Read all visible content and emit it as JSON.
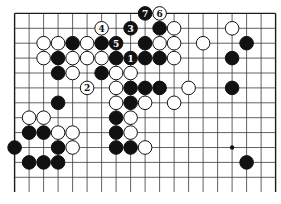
{
  "diagram": {
    "type": "go-board-partial",
    "columns": 19,
    "visible_rows": 12,
    "edges": {
      "top": true,
      "left": true,
      "right": true,
      "bottom": false
    },
    "colors": {
      "black": "#111111",
      "white": "#ffffff",
      "line": "#3a3a3a",
      "background": "#ffffff"
    },
    "star_points": [
      {
        "col": 15,
        "row": 9
      }
    ],
    "stones": [
      {
        "col": 9,
        "row": 0,
        "color": "black",
        "label": "7"
      },
      {
        "col": 10,
        "row": 0,
        "color": "white",
        "label": "6"
      },
      {
        "col": 6,
        "row": 1,
        "color": "white",
        "label": "4"
      },
      {
        "col": 8,
        "row": 1,
        "color": "black",
        "label": "3"
      },
      {
        "col": 10,
        "row": 1,
        "color": "black"
      },
      {
        "col": 11,
        "row": 1,
        "color": "white"
      },
      {
        "col": 15,
        "row": 1,
        "color": "white"
      },
      {
        "col": 2,
        "row": 2,
        "color": "white"
      },
      {
        "col": 3,
        "row": 2,
        "color": "white"
      },
      {
        "col": 4,
        "row": 2,
        "color": "black"
      },
      {
        "col": 5,
        "row": 2,
        "color": "white"
      },
      {
        "col": 6,
        "row": 2,
        "color": "black"
      },
      {
        "col": 7,
        "row": 2,
        "color": "black",
        "label": "5"
      },
      {
        "col": 9,
        "row": 2,
        "color": "black"
      },
      {
        "col": 10,
        "row": 2,
        "color": "white"
      },
      {
        "col": 11,
        "row": 2,
        "color": "white"
      },
      {
        "col": 13,
        "row": 2,
        "color": "white"
      },
      {
        "col": 16,
        "row": 2,
        "color": "black"
      },
      {
        "col": 2,
        "row": 3,
        "color": "white"
      },
      {
        "col": 3,
        "row": 3,
        "color": "black"
      },
      {
        "col": 4,
        "row": 3,
        "color": "white"
      },
      {
        "col": 5,
        "row": 3,
        "color": "white"
      },
      {
        "col": 6,
        "row": 3,
        "color": "white"
      },
      {
        "col": 7,
        "row": 3,
        "color": "black"
      },
      {
        "col": 8,
        "row": 3,
        "color": "black",
        "label": "1"
      },
      {
        "col": 9,
        "row": 3,
        "color": "black"
      },
      {
        "col": 10,
        "row": 3,
        "color": "black"
      },
      {
        "col": 11,
        "row": 3,
        "color": "white"
      },
      {
        "col": 15,
        "row": 3,
        "color": "black"
      },
      {
        "col": 3,
        "row": 4,
        "color": "black"
      },
      {
        "col": 4,
        "row": 4,
        "color": "white"
      },
      {
        "col": 6,
        "row": 4,
        "color": "black"
      },
      {
        "col": 7,
        "row": 4,
        "color": "white"
      },
      {
        "col": 8,
        "row": 4,
        "color": "white"
      },
      {
        "col": 5,
        "row": 5,
        "color": "white",
        "label": "2"
      },
      {
        "col": 7,
        "row": 5,
        "color": "white"
      },
      {
        "col": 8,
        "row": 5,
        "color": "black"
      },
      {
        "col": 9,
        "row": 5,
        "color": "black"
      },
      {
        "col": 10,
        "row": 5,
        "color": "black"
      },
      {
        "col": 12,
        "row": 5,
        "color": "white"
      },
      {
        "col": 15,
        "row": 5,
        "color": "black"
      },
      {
        "col": 3,
        "row": 6,
        "color": "black"
      },
      {
        "col": 7,
        "row": 6,
        "color": "white"
      },
      {
        "col": 8,
        "row": 6,
        "color": "black"
      },
      {
        "col": 9,
        "row": 6,
        "color": "white"
      },
      {
        "col": 11,
        "row": 6,
        "color": "white"
      },
      {
        "col": 1,
        "row": 7,
        "color": "white"
      },
      {
        "col": 2,
        "row": 7,
        "color": "white"
      },
      {
        "col": 7,
        "row": 7,
        "color": "black"
      },
      {
        "col": 8,
        "row": 7,
        "color": "white"
      },
      {
        "col": 1,
        "row": 8,
        "color": "black"
      },
      {
        "col": 2,
        "row": 8,
        "color": "black"
      },
      {
        "col": 3,
        "row": 8,
        "color": "white"
      },
      {
        "col": 4,
        "row": 8,
        "color": "white"
      },
      {
        "col": 7,
        "row": 8,
        "color": "black"
      },
      {
        "col": 8,
        "row": 8,
        "color": "white"
      },
      {
        "col": 0,
        "row": 9,
        "color": "black"
      },
      {
        "col": 3,
        "row": 9,
        "color": "black"
      },
      {
        "col": 4,
        "row": 9,
        "color": "white"
      },
      {
        "col": 7,
        "row": 9,
        "color": "black"
      },
      {
        "col": 8,
        "row": 9,
        "color": "black"
      },
      {
        "col": 9,
        "row": 9,
        "color": "white"
      },
      {
        "col": 1,
        "row": 10,
        "color": "black"
      },
      {
        "col": 2,
        "row": 10,
        "color": "black"
      },
      {
        "col": 3,
        "row": 10,
        "color": "black"
      },
      {
        "col": 16,
        "row": 10,
        "color": "black"
      }
    ]
  }
}
